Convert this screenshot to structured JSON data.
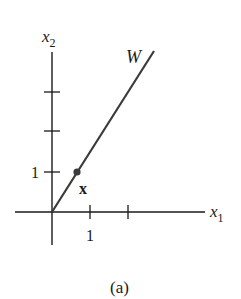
{
  "figure": {
    "caption": "(a)",
    "axes": {
      "x_label": "x",
      "x_label_sub": "1",
      "y_label": "x",
      "y_label_sub": "2",
      "x_tick_label": "1",
      "y_tick_label": "1"
    },
    "line_label": "W",
    "point_label": "x",
    "colors": {
      "axis": "#1a1a1a",
      "line": "#3a3a3a",
      "point": "#3a3a3a"
    }
  }
}
